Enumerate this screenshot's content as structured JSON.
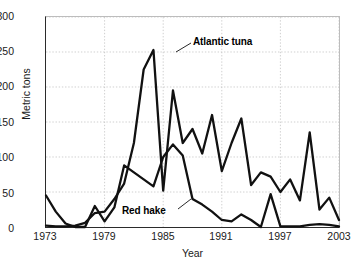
{
  "axes": {
    "y_title": "Metric tons",
    "x_title": "Year",
    "y_ticks": [
      "0",
      "50",
      "100",
      "150",
      "200",
      "250",
      "300"
    ],
    "x_ticks": [
      "1973",
      "1979",
      "1985",
      "1991",
      "1997",
      "2003"
    ]
  },
  "labels": {
    "atlantic_tuna": "Atlantic tuna",
    "red_hake": "Red hake"
  },
  "colors": {
    "line": "#111111",
    "grid": "#b9b9b9",
    "axis": "#2b2b2b",
    "text": "#1a1a1a",
    "background": "#ffffff"
  },
  "chart_data": {
    "type": "line",
    "title": "",
    "xlabel": "Year",
    "ylabel": "Metric tons",
    "xlim": [
      1973,
      2003
    ],
    "ylim": [
      0,
      300
    ],
    "ytick_values": [
      0,
      50,
      100,
      150,
      200,
      250,
      300
    ],
    "xtick_values": [
      1973,
      1979,
      1985,
      1991,
      1997,
      2003
    ],
    "grid": true,
    "legend": "annotated-inline",
    "x": [
      1973,
      1974,
      1975,
      1976,
      1977,
      1978,
      1979,
      1980,
      1981,
      1982,
      1983,
      1984,
      1985,
      1986,
      1987,
      1988,
      1989,
      1990,
      1991,
      1992,
      1993,
      1994,
      1995,
      1996,
      1997,
      1998,
      1999,
      2000,
      2001,
      2002,
      2003
    ],
    "series": [
      {
        "name": "Atlantic tuna",
        "values": [
          2,
          1,
          1,
          2,
          6,
          20,
          22,
          40,
          62,
          120,
          225,
          253,
          52,
          195,
          120,
          140,
          105,
          160,
          80,
          120,
          155,
          60,
          78,
          72,
          50,
          68,
          38,
          135,
          25,
          42,
          10
        ]
      },
      {
        "name": "Red hake",
        "values": [
          45,
          22,
          5,
          0,
          0,
          30,
          8,
          28,
          88,
          78,
          68,
          58,
          100,
          118,
          102,
          40,
          32,
          22,
          10,
          8,
          18,
          10,
          0,
          47,
          1,
          1,
          1,
          3,
          4,
          3,
          1
        ]
      }
    ]
  }
}
